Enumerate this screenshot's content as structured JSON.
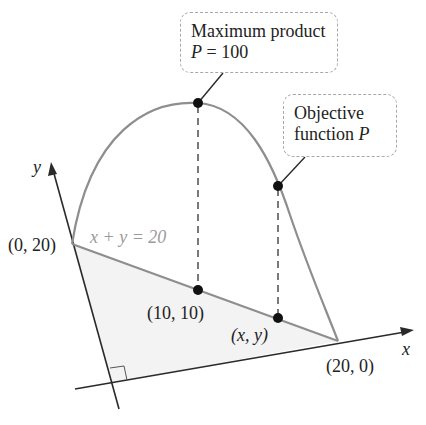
{
  "diagram": {
    "colors": {
      "axis": "#2a2a2a",
      "curve": "#8e8e8e",
      "constraint_line": "#8e8e8e",
      "region_fill": "#f3f3f3",
      "point": "#111111",
      "callout_border": "#a8a8a8",
      "constraint_label": "#9a9a9a"
    },
    "axes": {
      "x_label": "x",
      "y_label": "y"
    },
    "constraint": {
      "label": "x + y = 20",
      "endpoint_y_intercept": "(0, 20)",
      "endpoint_x_intercept": "(20, 0)"
    },
    "points": {
      "midpoint": "(10, 10)",
      "general": "(x, y)"
    },
    "callouts": {
      "maximum": {
        "line1": "Maximum product",
        "line2_var": "P",
        "line2_rest": " = 100"
      },
      "objective": {
        "line1": "Objective",
        "line2_text": "function ",
        "line2_var": "P"
      }
    }
  }
}
